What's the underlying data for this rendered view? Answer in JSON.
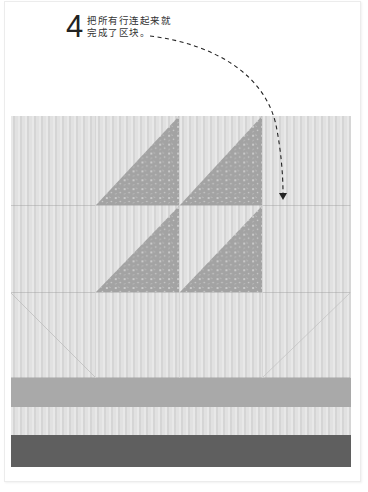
{
  "step": {
    "number": "4",
    "lines": [
      "把所有行连起来就",
      "完成了区块。"
    ]
  },
  "quilt": {
    "rows": [
      {
        "cells": [
          "plain",
          "triangle",
          "triangle",
          "plain"
        ]
      },
      {
        "cells": [
          "plain",
          "triangle",
          "triangle",
          "plain"
        ]
      },
      {
        "cells": [
          "diagonal-seam-left",
          "plain",
          "plain",
          "diagonal-seam-right"
        ]
      }
    ],
    "bands": [
      "mid-gray",
      "light-stripe",
      "dark-gray"
    ]
  },
  "colors": {
    "stripe_fabric": "#dcdcdc",
    "print_fabric": "#a3a3a3",
    "mid_band": "#a9a9a9",
    "dark_band": "#5f5f5f",
    "arrow": "#222222"
  },
  "icons": {
    "arrow": "dashed-curved-arrow-down"
  }
}
